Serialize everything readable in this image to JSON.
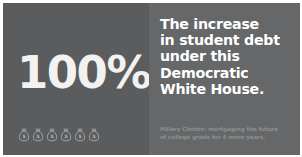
{
  "ad": {
    "stat": {
      "value": "100%",
      "icon_name": "money-bag-icon",
      "icon_count": 6
    },
    "headline_lines": [
      "The increase",
      "in student debt",
      "under this",
      "Democratic",
      "White House."
    ],
    "caption_lines": [
      "Hillary Clinton: mortgaging the future",
      "of college grads for 4 more years."
    ],
    "colors": {
      "panel_left_bg": "#5a5c5e",
      "panel_right_bg": "#656769",
      "stat_text": "#f2f2f0",
      "headline_text": "#ffffff",
      "caption_text": "#8d8f90",
      "page_bg": "#ffffff"
    }
  }
}
